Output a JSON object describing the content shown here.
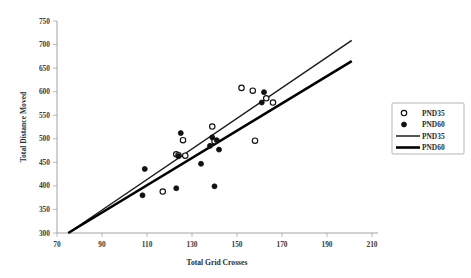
{
  "chart_data": {
    "type": "scatter",
    "title": "",
    "xlabel": "Total Grid Crosses",
    "ylabel": "Total Distance Moved",
    "xlim": [
      70,
      210
    ],
    "ylim": [
      300,
      750
    ],
    "xticks": [
      70,
      90,
      110,
      130,
      150,
      170,
      190,
      210
    ],
    "yticks": [
      300,
      350,
      400,
      450,
      500,
      550,
      600,
      650,
      700,
      750
    ],
    "grid": false,
    "legend_position": "right",
    "legend": [
      "PND35",
      "PND60",
      "PND35",
      "PND60"
    ],
    "series": [
      {
        "name": "PND35",
        "marker": "open-circle",
        "points": [
          [
            117,
            388
          ],
          [
            123,
            467
          ],
          [
            124,
            465
          ],
          [
            126,
            497
          ],
          [
            127,
            464
          ],
          [
            139,
            526
          ],
          [
            140,
            495
          ],
          [
            152,
            608
          ],
          [
            157,
            602
          ],
          [
            158,
            496
          ],
          [
            163,
            586
          ],
          [
            166,
            577
          ]
        ]
      },
      {
        "name": "PND60",
        "marker": "filled-circle",
        "points": [
          [
            108,
            380
          ],
          [
            109,
            436
          ],
          [
            123,
            395
          ],
          [
            124,
            463
          ],
          [
            125,
            512
          ],
          [
            134,
            447
          ],
          [
            138,
            485
          ],
          [
            139,
            503
          ],
          [
            140,
            399
          ],
          [
            141,
            497
          ],
          [
            142,
            477
          ],
          [
            161,
            577
          ],
          [
            162,
            599
          ]
        ]
      }
    ],
    "fit_lines": [
      {
        "name": "PND35",
        "style": "thin",
        "x_start": 75,
        "y_start": 300,
        "x_end": 201,
        "y_end": 709
      },
      {
        "name": "PND60",
        "style": "thick",
        "x_start": 75,
        "y_start": 300,
        "x_end": 201,
        "y_end": 665
      }
    ]
  },
  "legend": {
    "entries": [
      {
        "label": "PND35",
        "kind": "open-circle"
      },
      {
        "label": "PND60",
        "kind": "filled-circle"
      },
      {
        "label": "PND35",
        "kind": "thin-line"
      },
      {
        "label": "PND60",
        "kind": "thick-line"
      }
    ]
  }
}
